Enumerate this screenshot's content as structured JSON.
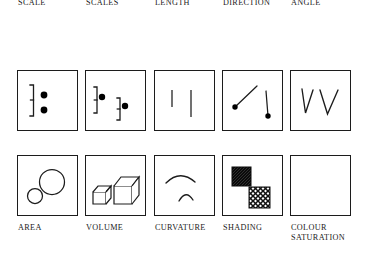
{
  "figure": {
    "stroke_color": "#1c1c1c",
    "fill_color": "#000000",
    "background": "#ffffff",
    "rows": 2,
    "columns": 5
  },
  "tasks": [
    {
      "id": "position-common-scale",
      "label": "POSITION\nCOMMON\nSCALE",
      "row": "top",
      "column": 0,
      "glyph": "two filled dots on a single shared vertical scale bracket"
    },
    {
      "id": "position-non-aligned-scales",
      "label": "POSITION\nNON-\nALIGNED\nSCALES",
      "row": "top",
      "column": 1,
      "glyph": "two filled dots each on its own separate offset scale bracket"
    },
    {
      "id": "length",
      "label": "LENGTH",
      "row": "top",
      "column": 2,
      "glyph": "two vertical line segments of differing length"
    },
    {
      "id": "direction",
      "label": "DIRECTION",
      "row": "top",
      "column": 3,
      "glyph": "two line segments at different orientations, each anchored by a dot"
    },
    {
      "id": "angle",
      "label": "ANGLE",
      "row": "top",
      "column": 4,
      "glyph": "two V shapes, one narrow angle and one wide angle"
    },
    {
      "id": "area",
      "label": "AREA",
      "row": "bottom",
      "column": 0,
      "glyph": "two outlined circles of differing radius"
    },
    {
      "id": "volume",
      "label": "VOLUME",
      "row": "bottom",
      "column": 1,
      "glyph": "two wireframe isometric cubes of differing size"
    },
    {
      "id": "curvature",
      "label": "CURVATURE",
      "row": "bottom",
      "column": 2,
      "glyph": "a shallow wide arc above a tight small arc"
    },
    {
      "id": "shading",
      "label": "SHADING",
      "row": "bottom",
      "column": 3,
      "glyph": "a dark densely hatched square and a lighter cross-hatched square"
    },
    {
      "id": "colour-saturation",
      "label": "COLOUR\nSATURATION",
      "row": "bottom",
      "column": 4,
      "glyph": "empty panel"
    }
  ]
}
